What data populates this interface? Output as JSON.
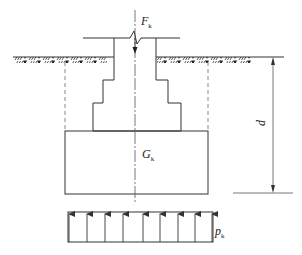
{
  "diagram": {
    "type": "foundation-load-section",
    "labels": {
      "axial_load": {
        "symbol": "F",
        "subscript": "k"
      },
      "self_weight": {
        "symbol": "G",
        "subscript": "k"
      },
      "base_pressure": {
        "symbol": "p",
        "subscript": "k"
      },
      "depth": {
        "symbol": "d"
      }
    },
    "colors": {
      "line": "#333333",
      "dashed": "#888888",
      "background": "#ffffff"
    },
    "pressure_arrow_count": 9
  }
}
